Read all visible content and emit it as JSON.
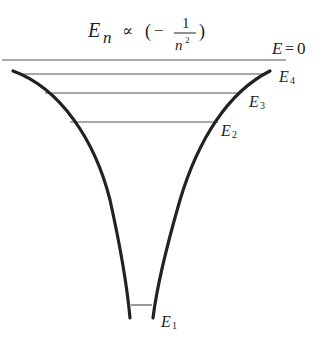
{
  "title": {
    "symbol": "E",
    "subscript": "n",
    "relation": "∝",
    "open": "(",
    "minus": "−",
    "numerator": "1",
    "denominator_base": "n",
    "denominator_exp": "2",
    "close": ")"
  },
  "zero_level": {
    "symbol": "E",
    "equals": "=",
    "value": "0",
    "y": 60
  },
  "levels": [
    {
      "name": "E4",
      "symbol": "E",
      "index": "4",
      "y": 74,
      "x1": 22,
      "x2": 262
    },
    {
      "name": "E3",
      "symbol": "E",
      "index": "3",
      "y": 93,
      "x1": 45,
      "x2": 240
    },
    {
      "name": "E2",
      "symbol": "E",
      "index": "2",
      "y": 122,
      "x1": 70,
      "x2": 218
    },
    {
      "name": "E1",
      "symbol": "E",
      "index": "1",
      "y": 305,
      "x1": 130,
      "x2": 152
    }
  ],
  "colors": {
    "curve": "#222222",
    "level_line": "#555555",
    "text": "#222222"
  }
}
